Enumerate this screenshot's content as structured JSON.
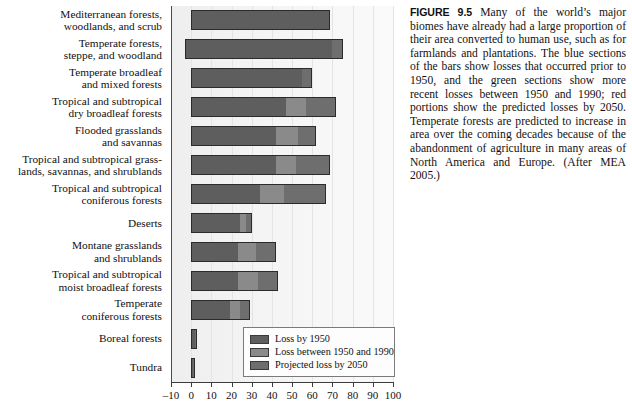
{
  "figure": {
    "label": "FIGURE 9.5",
    "caption": " Many of the world’s major biomes have already had a large proportion of their area converted to human use, such as for farmlands and plantations. The blue sections of the bars show losses that occurred prior to 1950, and the green sections show more recent losses between 1950 and 1990; red portions show the predicted losses by 2050. Temperate forests are predicted to increase in area over the coming decades because of the abandonment of agriculture in many areas of North America and Europe. (After MEA 2005.)"
  },
  "legend": {
    "items": [
      {
        "label": "Loss by 1950",
        "color": "#5e5e5e",
        "swatch_name": "legend-swatch-loss-by-1950"
      },
      {
        "label": "Loss between 1950 and 1990",
        "color": "#8a8a8a",
        "swatch_name": "legend-swatch-loss-1950-1990"
      },
      {
        "label": "Projected loss by 2050",
        "color": "#6e6e6e",
        "swatch_name": "legend-swatch-projected-2050"
      }
    ]
  },
  "chart_data": {
    "type": "bar",
    "orientation": "horizontal",
    "stacked": true,
    "title": "",
    "xlabel": "",
    "ylabel": "",
    "xlim": [
      -10,
      100
    ],
    "xticks": [
      -10,
      0,
      10,
      20,
      30,
      40,
      50,
      60,
      70,
      80,
      90,
      100
    ],
    "xtick_labels": [
      "–10",
      "0",
      "10",
      "20",
      "30",
      "40",
      "50",
      "60",
      "70",
      "80",
      "90",
      "100"
    ],
    "grid": true,
    "legend_position": "inside-bottom-right",
    "series": [
      {
        "name": "Loss by 1950",
        "color": "#5e5e5e"
      },
      {
        "name": "Loss between 1950 and 1990",
        "color": "#8a8a8a"
      },
      {
        "name": "Projected loss by 2050",
        "color": "#6e6e6e"
      }
    ],
    "categories": [
      "Mediterranean forests, woodlands, and scrub",
      "Temperate forests, steppe, and woodland",
      "Temperate broadleaf and mixed forests",
      "Tropical and subtropical dry broadleaf forests",
      "Flooded grasslands and savannas",
      "Tropical and subtropical grasslands, savannas, and shrublands",
      "Tropical and subtropical coniferous forests",
      "Deserts",
      "Montane grasslands and shrublands",
      "Tropical and subtropical moist broadleaf forests",
      "Temperate coniferous forests",
      "Boreal forests",
      "Tundra"
    ],
    "category_labels": [
      [
        "Mediterranean forests,",
        "woodlands, and scrub"
      ],
      [
        "Temperate forests,",
        "steppe, and woodland"
      ],
      [
        "Temperate broadleaf",
        "and mixed forests"
      ],
      [
        "Tropical and subtropical",
        "dry broadleaf forests"
      ],
      [
        "Flooded grasslands",
        "and savannas"
      ],
      [
        "Tropical and subtropical grass-",
        "lands, savannas, and shrublands"
      ],
      [
        "Tropical and subtropical",
        "coniferous forests"
      ],
      [
        "Deserts"
      ],
      [
        "Montane grasslands",
        "and shrublands"
      ],
      [
        "Tropical and subtropical",
        "moist broadleaf forests"
      ],
      [
        "Temperate",
        "coniferous forests"
      ],
      [
        "Boreal forests"
      ],
      [
        "Tundra"
      ]
    ],
    "bars": [
      {
        "category": "Mediterranean forests, woodlands, and scrub",
        "start": 0,
        "loss_by_1950": 69,
        "loss_1950_1990": 0,
        "projected_2050": 0,
        "total": 69
      },
      {
        "category": "Temperate forests, steppe, and woodland",
        "start": -3,
        "loss_by_1950": 73,
        "loss_1950_1990": 0,
        "projected_2050": 5,
        "total": 75
      },
      {
        "category": "Temperate broadleaf and mixed forests",
        "start": 0,
        "loss_by_1950": 55,
        "loss_1950_1990": 0,
        "projected_2050": 5,
        "total": 60
      },
      {
        "category": "Tropical and subtropical dry broadleaf forests",
        "start": 0,
        "loss_by_1950": 47,
        "loss_1950_1990": 10,
        "projected_2050": 15,
        "total": 72
      },
      {
        "category": "Flooded grasslands and savannas",
        "start": 0,
        "loss_by_1950": 42,
        "loss_1950_1990": 11,
        "projected_2050": 9,
        "total": 62
      },
      {
        "category": "Tropical and subtropical grasslands, savannas, and shrublands",
        "start": 0,
        "loss_by_1950": 42,
        "loss_1950_1990": 10,
        "projected_2050": 17,
        "total": 69
      },
      {
        "category": "Tropical and subtropical coniferous forests",
        "start": 0,
        "loss_by_1950": 34,
        "loss_1950_1990": 12,
        "projected_2050": 21,
        "total": 67
      },
      {
        "category": "Deserts",
        "start": 0,
        "loss_by_1950": 24,
        "loss_1950_1990": 3,
        "projected_2050": 3,
        "total": 30
      },
      {
        "category": "Montane grasslands and shrublands",
        "start": 0,
        "loss_by_1950": 23,
        "loss_1950_1990": 9,
        "projected_2050": 10,
        "total": 42
      },
      {
        "category": "Tropical and subtropical moist broadleaf forests",
        "start": 0,
        "loss_by_1950": 23,
        "loss_1950_1990": 10,
        "projected_2050": 10,
        "total": 43
      },
      {
        "category": "Temperate coniferous forests",
        "start": 0,
        "loss_by_1950": 19,
        "loss_1950_1990": 5,
        "projected_2050": 5,
        "total": 29
      },
      {
        "category": "Boreal forests",
        "start": 0,
        "loss_by_1950": 2,
        "loss_1950_1990": 0,
        "projected_2050": 1,
        "total": 3
      },
      {
        "category": "Tundra",
        "start": 0,
        "loss_by_1950": 1,
        "loss_1950_1990": 0,
        "projected_2050": 1,
        "total": 2
      }
    ]
  }
}
